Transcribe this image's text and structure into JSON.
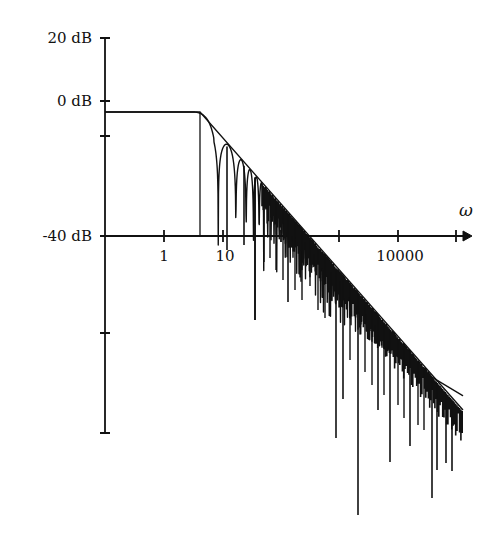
{
  "chart_data": {
    "type": "line",
    "title": "",
    "xlabel": "ω",
    "ylabel": "",
    "x_scale": "log",
    "y_axis": {
      "tick_labels": [
        "20 dB",
        "0 dB",
        "-40 dB"
      ],
      "tick_values_db": [
        20,
        0,
        -10,
        -40,
        -70,
        -100
      ],
      "labeled_ticks": [
        {
          "label": "20 dB",
          "value": 20
        },
        {
          "label": "0 dB",
          "value": 0
        },
        {
          "label": "-40 dB",
          "value": -40
        }
      ]
    },
    "x_axis": {
      "tick_values": [
        1,
        10,
        100,
        1000,
        10000,
        100000
      ],
      "labeled_ticks": [
        {
          "label": "1",
          "value": 1
        },
        {
          "label": "10",
          "value": 10
        },
        {
          "label": "10000",
          "value": 10000
        }
      ],
      "axis_crosses_y_at_db": -40
    },
    "ylim": [
      -100,
      20
    ],
    "xlim": [
      0.1,
      200000
    ],
    "grid": false,
    "legend": null,
    "series": [
      {
        "name": "asymptote",
        "style": "thin solid line",
        "points": [
          {
            "x": 0.1,
            "y": -3.5
          },
          {
            "x": 5,
            "y": -3.5
          },
          {
            "x": 150000,
            "y": -91
          }
        ]
      },
      {
        "name": "cutoff-marker",
        "style": "vertical line",
        "points": [
          {
            "x": 5,
            "y": -3.5
          },
          {
            "x": 5,
            "y": -40
          }
        ]
      },
      {
        "name": "magnitude-response",
        "style": "oscillating sinc-like response with notches below the asymptote",
        "passband_db": -3.5,
        "corner_omega": 5,
        "first_notches_omega": [
          10.5,
          20,
          31
        ],
        "notable_notch_depths": [
          {
            "x_px": 255,
            "y_px": 320
          },
          {
            "x_px": 288,
            "y_px": 302
          },
          {
            "x_px": 336,
            "y_px": 438
          },
          {
            "x_px": 343,
            "y_px": 399
          },
          {
            "x_px": 358,
            "y_px": 515
          },
          {
            "x_px": 378,
            "y_px": 410
          },
          {
            "x_px": 390,
            "y_px": 462
          },
          {
            "x_px": 410,
            "y_px": 446
          },
          {
            "x_px": 432,
            "y_px": 498
          },
          {
            "x_px": 437,
            "y_px": 470
          },
          {
            "x_px": 446,
            "y_px": 463
          },
          {
            "x_px": 452,
            "y_px": 471
          }
        ]
      }
    ],
    "annotations": [
      {
        "text": "ω",
        "position": "end of x-axis, above arrow"
      }
    ]
  },
  "layout_px": {
    "y_axis_x": 105,
    "y_axis_top": 38,
    "y_axis_bottom": 433,
    "x_axis_y": 236,
    "x_axis_end": 472,
    "y_ticks_px": [
      38,
      101,
      136,
      236,
      333,
      433
    ],
    "x_ticks_px": [
      164,
      223,
      281,
      339,
      398,
      456
    ],
    "flat_y": 112,
    "corner_x": 200,
    "asym_end": [
      463,
      410
    ]
  },
  "labels": {
    "y20": "20 dB",
    "y0": "0 dB",
    "ym40": "-40 dB",
    "x1": "1",
    "x10": "10",
    "x10000": "10000",
    "omega": "ω"
  },
  "colors": {
    "ink": "#111111",
    "background": "#ffffff"
  }
}
